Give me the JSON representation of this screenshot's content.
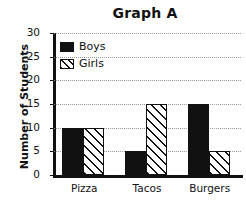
{
  "chart_data": {
    "type": "bar",
    "title": "Graph A",
    "xlabel": "",
    "ylabel": "Number of Students",
    "categories": [
      "Pizza",
      "Tacos",
      "Burgers"
    ],
    "series": [
      {
        "name": "Boys",
        "values": [
          10,
          5,
          15
        ],
        "color": "#111111",
        "fill": "solid"
      },
      {
        "name": "Girls",
        "values": [
          10,
          15,
          5
        ],
        "color": "#111111",
        "fill": "diagonal-hatch"
      }
    ],
    "ylim": [
      0,
      30
    ],
    "ytick_step": 5,
    "yticks": [
      0,
      5,
      10,
      15,
      20,
      25,
      30
    ],
    "ytick_labels": [
      "0",
      "5",
      "10",
      "15",
      "20",
      "25",
      "30"
    ],
    "grid": true,
    "grid_style": "dotted",
    "legend_position": "top-left-inside",
    "background_color": "#ffffff"
  },
  "legend": {
    "entries": [
      {
        "label": "Boys",
        "swatch": "solid-black-swatch"
      },
      {
        "label": "Girls",
        "swatch": "hatched-swatch"
      }
    ]
  }
}
